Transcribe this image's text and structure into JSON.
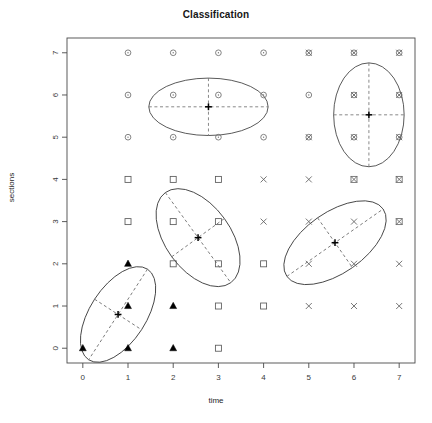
{
  "chart_data": {
    "type": "scatter",
    "title": "Classification",
    "xlabel": "time",
    "ylabel": "sections",
    "xlim": [
      -0.35,
      7.35
    ],
    "ylim": [
      -0.35,
      7.35
    ],
    "xticks": [
      0,
      1,
      2,
      3,
      4,
      5,
      6,
      7
    ],
    "yticks": [
      0,
      1,
      2,
      3,
      4,
      5,
      6,
      7
    ],
    "xtick_labels": [
      "0",
      "1",
      "2",
      "3",
      "4",
      "5",
      "6",
      "7"
    ],
    "ytick_labels": [
      "0",
      "1",
      "2",
      "3",
      "4",
      "5",
      "6",
      "7"
    ],
    "grid": false,
    "legend": "none",
    "box": true,
    "series": [
      {
        "name": "cluster-1",
        "symbol": "filled-triangle",
        "color": "#000000",
        "points": [
          {
            "x": 0,
            "y": 0
          },
          {
            "x": 1,
            "y": 0
          },
          {
            "x": 2,
            "y": 0
          },
          {
            "x": 1,
            "y": 1
          },
          {
            "x": 2,
            "y": 1
          },
          {
            "x": 1,
            "y": 2
          }
        ]
      },
      {
        "name": "cluster-2",
        "symbol": "open-square",
        "color": "#5a5a5a",
        "points": [
          {
            "x": 3,
            "y": 0
          },
          {
            "x": 3,
            "y": 1
          },
          {
            "x": 4,
            "y": 1
          },
          {
            "x": 2,
            "y": 2
          },
          {
            "x": 3,
            "y": 2
          },
          {
            "x": 4,
            "y": 2
          },
          {
            "x": 1,
            "y": 3
          },
          {
            "x": 2,
            "y": 3
          },
          {
            "x": 3,
            "y": 3
          },
          {
            "x": 1,
            "y": 4
          },
          {
            "x": 2,
            "y": 4
          },
          {
            "x": 3,
            "y": 4
          }
        ]
      },
      {
        "name": "cluster-3",
        "symbol": "open-circle",
        "color": "#6e6e6e",
        "points": [
          {
            "x": 1,
            "y": 5
          },
          {
            "x": 2,
            "y": 5
          },
          {
            "x": 3,
            "y": 5
          },
          {
            "x": 4,
            "y": 5
          },
          {
            "x": 1,
            "y": 6
          },
          {
            "x": 2,
            "y": 6
          },
          {
            "x": 3,
            "y": 6
          },
          {
            "x": 4,
            "y": 6
          },
          {
            "x": 5,
            "y": 6
          },
          {
            "x": 1,
            "y": 7
          },
          {
            "x": 2,
            "y": 7
          },
          {
            "x": 3,
            "y": 7
          },
          {
            "x": 4,
            "y": 7
          }
        ]
      },
      {
        "name": "cluster-4",
        "symbol": "cross-x",
        "color": "#5f5f5f",
        "points": [
          {
            "x": 5,
            "y": 1
          },
          {
            "x": 6,
            "y": 1
          },
          {
            "x": 7,
            "y": 1
          },
          {
            "x": 5,
            "y": 2
          },
          {
            "x": 6,
            "y": 2
          },
          {
            "x": 7,
            "y": 2
          },
          {
            "x": 4,
            "y": 3
          },
          {
            "x": 5,
            "y": 3
          },
          {
            "x": 6,
            "y": 3
          },
          {
            "x": 7,
            "y": 3
          },
          {
            "x": 4,
            "y": 4
          },
          {
            "x": 5,
            "y": 4
          },
          {
            "x": 6,
            "y": 4
          },
          {
            "x": 7,
            "y": 4
          },
          {
            "x": 5,
            "y": 5
          },
          {
            "x": 6,
            "y": 5
          },
          {
            "x": 7,
            "y": 5
          },
          {
            "x": 6,
            "y": 6
          },
          {
            "x": 7,
            "y": 6
          },
          {
            "x": 5,
            "y": 7
          },
          {
            "x": 6,
            "y": 7
          },
          {
            "x": 7,
            "y": 7
          }
        ]
      },
      {
        "name": "cluster-overlap-squares",
        "symbol": "open-square",
        "color": "#6a6a6a",
        "points": [
          {
            "x": 6,
            "y": 4
          },
          {
            "x": 7,
            "y": 4
          },
          {
            "x": 7,
            "y": 3
          }
        ]
      },
      {
        "name": "cluster-overlap-circles",
        "symbol": "open-circle",
        "color": "#6a6a6a",
        "points": [
          {
            "x": 5,
            "y": 7
          },
          {
            "x": 6,
            "y": 7
          },
          {
            "x": 7,
            "y": 7
          },
          {
            "x": 6,
            "y": 6
          },
          {
            "x": 7,
            "y": 6
          },
          {
            "x": 5,
            "y": 5
          },
          {
            "x": 6,
            "y": 5
          },
          {
            "x": 7,
            "y": 5
          }
        ]
      }
    ],
    "ellipses": [
      {
        "name": "ellipse-cluster-1",
        "cx": 0.78,
        "cy": 0.8,
        "rx": 0.62,
        "ry": 1.28,
        "angle": -33,
        "centroid_symbol": "plus"
      },
      {
        "name": "ellipse-cluster-2",
        "cx": 2.55,
        "cy": 2.62,
        "rx": 0.72,
        "ry": 1.32,
        "angle": 36,
        "centroid_symbol": "plus"
      },
      {
        "name": "ellipse-cluster-3",
        "cx": 2.78,
        "cy": 5.72,
        "rx": 1.32,
        "ry": 0.68,
        "angle": 0,
        "centroid_symbol": "plus"
      },
      {
        "name": "ellipse-cluster-4",
        "cx": 5.58,
        "cy": 2.5,
        "rx": 1.3,
        "ry": 0.72,
        "angle": 35,
        "centroid_symbol": "plus"
      },
      {
        "name": "ellipse-cluster-5",
        "cx": 6.33,
        "cy": 5.53,
        "rx": 0.78,
        "ry": 1.23,
        "angle": 0,
        "centroid_symbol": "plus"
      }
    ],
    "colors": {
      "axis": "#4a4a4a",
      "ellipse": "#3c3c3c",
      "dashed_axis": "#6b6b6b",
      "centroid": "#000000",
      "title": "#161616"
    }
  }
}
